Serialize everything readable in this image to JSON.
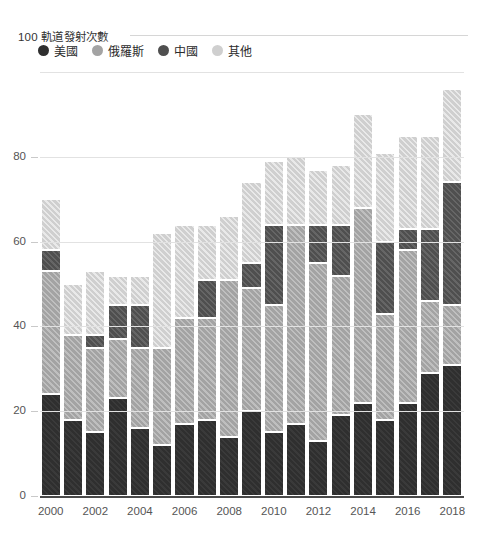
{
  "title": "100 軌道發射次數",
  "legend": {
    "position": "top-left",
    "items": [
      {
        "label": "美國",
        "color": "#2f2f2f",
        "key": "us"
      },
      {
        "label": "俄羅斯",
        "color": "#a3a3a3",
        "key": "ru"
      },
      {
        "label": "中國",
        "color": "#4f4f4f",
        "key": "cn"
      },
      {
        "label": "其他",
        "color": "#cfcfcf",
        "key": "ot"
      }
    ]
  },
  "chart_data": {
    "type": "bar",
    "stacked": true,
    "title": "100 軌道發射次數",
    "xlabel": "",
    "ylabel": "",
    "ylim": [
      0,
      100
    ],
    "yticks": [
      0,
      20,
      40,
      60,
      80,
      100
    ],
    "grid": true,
    "x": [
      2000,
      2001,
      2002,
      2003,
      2004,
      2005,
      2006,
      2007,
      2008,
      2009,
      2010,
      2011,
      2012,
      2013,
      2014,
      2015,
      2016,
      2017,
      2018
    ],
    "xtick_labels": [
      "2000",
      "",
      "2002",
      "",
      "2004",
      "",
      "2006",
      "",
      "2008",
      "",
      "2010",
      "",
      "2012",
      "",
      "2014",
      "",
      "2016",
      "",
      "2018"
    ],
    "categories": [
      "2000",
      "2001",
      "2002",
      "2003",
      "2004",
      "2005",
      "2006",
      "2007",
      "2008",
      "2009",
      "2010",
      "2011",
      "2012",
      "2013",
      "2014",
      "2015",
      "2016",
      "2017",
      "2018"
    ],
    "series": [
      {
        "name": "美國",
        "color": "#2f2f2f",
        "values": [
          24,
          18,
          15,
          23,
          16,
          12,
          17,
          18,
          14,
          20,
          15,
          17,
          13,
          19,
          22,
          18,
          22,
          29,
          31
        ]
      },
      {
        "name": "俄羅斯",
        "color": "#a3a3a3",
        "values": [
          29,
          20,
          20,
          14,
          19,
          23,
          25,
          24,
          37,
          29,
          30,
          47,
          42,
          33,
          46,
          25,
          36,
          17,
          14
        ]
      },
      {
        "name": "中國",
        "color": "#4f4f4f",
        "values": [
          5,
          0,
          3,
          8,
          10,
          0,
          0,
          9,
          0,
          6,
          19,
          0,
          9,
          12,
          0,
          17,
          5,
          17,
          29
        ]
      },
      {
        "name": "其他",
        "color": "#cfcfcf",
        "values": [
          12,
          12,
          15,
          7,
          7,
          27,
          22,
          13,
          15,
          19,
          15,
          16,
          13,
          14,
          22,
          21,
          22,
          22,
          22
        ]
      }
    ],
    "totals": [
      70,
      50,
      53,
      52,
      52,
      62,
      64,
      64,
      66,
      74,
      79,
      80,
      77,
      78,
      90,
      81,
      85,
      85,
      96
    ],
    "annotations": []
  }
}
